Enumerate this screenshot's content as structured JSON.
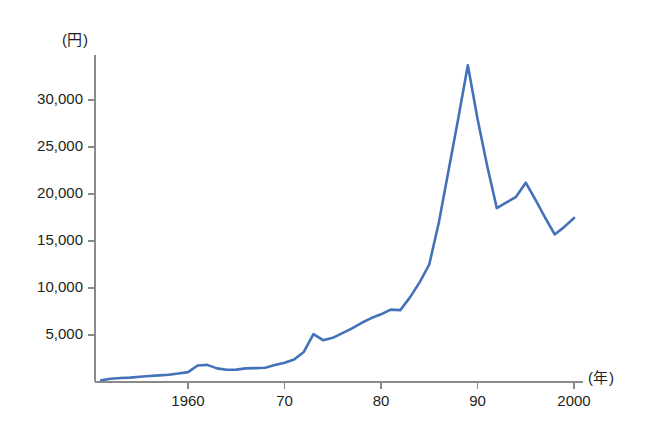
{
  "chart_data": {
    "type": "line",
    "title": "",
    "subtitle": "",
    "xlabel": "(年)",
    "ylabel": "(円)",
    "xlim": [
      1950,
      2001
    ],
    "ylim": [
      0,
      35000
    ],
    "grid": false,
    "legend_position": "none",
    "line_color": "#4472b8",
    "axis_color": "#8a8a8a",
    "y_ticks": [
      {
        "value": 5000,
        "label": "5,000"
      },
      {
        "value": 10000,
        "label": "10,000"
      },
      {
        "value": 15000,
        "label": "15,000"
      },
      {
        "value": 20000,
        "label": "20,000"
      },
      {
        "value": 25000,
        "label": "25,000"
      },
      {
        "value": 30000,
        "label": "30,000"
      }
    ],
    "x_ticks": [
      {
        "value": 1960,
        "label": "1960"
      },
      {
        "value": 1970,
        "label": "70"
      },
      {
        "value": 1980,
        "label": "80"
      },
      {
        "value": 1990,
        "label": "90"
      },
      {
        "value": 2000,
        "label": "2000"
      }
    ],
    "series": [
      {
        "name": "",
        "x": [
          1951,
          1952,
          1953,
          1954,
          1955,
          1956,
          1957,
          1958,
          1959,
          1960,
          1961,
          1962,
          1963,
          1964,
          1965,
          1966,
          1967,
          1968,
          1969,
          1970,
          1971,
          1972,
          1973,
          1974,
          1975,
          1976,
          1977,
          1978,
          1979,
          1980,
          1981,
          1982,
          1983,
          1984,
          1985,
          1986,
          1987,
          1988,
          1989,
          1990,
          1991,
          1992,
          1993,
          1994,
          1995,
          1996,
          1997,
          1998,
          1999,
          2000
        ],
        "values": [
          180,
          350,
          420,
          470,
          560,
          640,
          700,
          770,
          900,
          1050,
          1750,
          1820,
          1450,
          1300,
          1320,
          1450,
          1480,
          1520,
          1800,
          2050,
          2400,
          3200,
          5100,
          4450,
          4700,
          5200,
          5700,
          6300,
          6800,
          7200,
          7700,
          7650,
          9000,
          10600,
          12500,
          17000,
          22500,
          28000,
          33700,
          28000,
          23000,
          18500,
          19100,
          19700,
          21200,
          19400,
          17500,
          15700,
          16500,
          17450
        ]
      }
    ]
  }
}
